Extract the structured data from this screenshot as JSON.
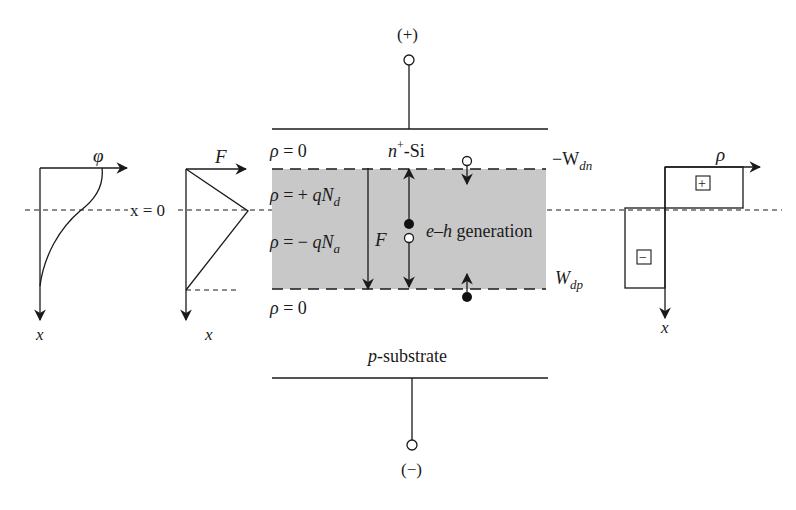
{
  "figure": {
    "type": "p-n junction photodiode under reverse bias",
    "colors": {
      "line": "#1a1a1a",
      "depletion_fill": "#c8c8c8",
      "background": "#ffffff"
    }
  },
  "terminals": {
    "top": "(+)",
    "bottom": "(−)"
  },
  "layers": {
    "top_label_n": "n",
    "top_label_sup": "+",
    "top_label_rest": "-Si",
    "bottom_label_p": "p",
    "bottom_label_rest": "-substrate"
  },
  "charge_labels": {
    "rho_zero_top": "ρ = 0",
    "rho_plus": "ρ = + qN",
    "rho_plus_sub": "d",
    "rho_minus": "ρ = − qN",
    "rho_minus_sub": "a",
    "rho_zero_bottom": "ρ = 0"
  },
  "boundaries": {
    "top_W": "−W",
    "top_sub": "dn",
    "bottom_W": "W",
    "bottom_sub": "dp"
  },
  "inner": {
    "field_label": "F",
    "generation_prefix": "e–h",
    "generation_rest": " generation"
  },
  "plots": {
    "potential": {
      "axis_label_h": "φ",
      "axis_label_v": "x"
    },
    "field": {
      "axis_label_h": "F",
      "axis_label_v": "x"
    },
    "charge": {
      "axis_label_h": "ρ",
      "axis_label_v": "x",
      "plus_sign": "+",
      "minus_sign": "−"
    }
  },
  "origin_label": "x = 0"
}
